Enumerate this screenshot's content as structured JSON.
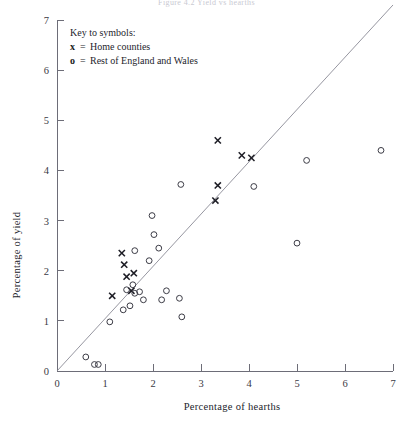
{
  "figure": {
    "title_partial": "Figure 4.2  Yield vs hearths"
  },
  "legend": {
    "heading": "Key to symbols:",
    "entries": [
      {
        "symbol": "x",
        "equals": "=",
        "label": "Home counties"
      },
      {
        "symbol": "o",
        "equals": "=",
        "label": "Rest of England and Wales"
      }
    ]
  },
  "chart_data": {
    "type": "scatter",
    "title": "",
    "xlabel": "Percentage of hearths",
    "ylabel": "Percentage of yield",
    "xlim": [
      0,
      7
    ],
    "ylim": [
      0,
      7
    ],
    "xticks": [
      "0",
      "1",
      "2",
      "3",
      "4",
      "5",
      "6",
      "7"
    ],
    "yticks": [
      "0",
      "1",
      "2",
      "3",
      "4",
      "5",
      "6",
      "7"
    ],
    "grid": false,
    "legend_position": "top-left",
    "reference_line": {
      "label": "y = x identity line",
      "x": [
        0.0,
        7.0
      ],
      "y": [
        0.0,
        7.3
      ],
      "color": "#8a8a95"
    },
    "series": [
      {
        "name": "Home counties",
        "marker": "x",
        "color": "#1d1d25",
        "points": [
          [
            1.15,
            1.5
          ],
          [
            1.35,
            2.35
          ],
          [
            1.4,
            2.12
          ],
          [
            1.45,
            1.88
          ],
          [
            1.6,
            1.95
          ],
          [
            1.55,
            1.6
          ],
          [
            3.35,
            4.6
          ],
          [
            3.35,
            3.7
          ],
          [
            3.3,
            3.4
          ],
          [
            3.85,
            4.3
          ],
          [
            4.05,
            4.25
          ]
        ]
      },
      {
        "name": "Rest of England and Wales",
        "marker": "o",
        "color": "#3c3c46",
        "points": [
          [
            0.6,
            0.28
          ],
          [
            0.78,
            0.13
          ],
          [
            0.86,
            0.13
          ],
          [
            1.1,
            0.98
          ],
          [
            1.38,
            1.22
          ],
          [
            1.52,
            1.3
          ],
          [
            1.45,
            1.62
          ],
          [
            1.58,
            1.72
          ],
          [
            1.62,
            1.55
          ],
          [
            1.72,
            1.58
          ],
          [
            1.8,
            1.42
          ],
          [
            1.62,
            2.4
          ],
          [
            1.92,
            2.2
          ],
          [
            1.98,
            3.1
          ],
          [
            2.02,
            2.72
          ],
          [
            2.12,
            2.45
          ],
          [
            2.18,
            1.42
          ],
          [
            2.28,
            1.6
          ],
          [
            2.55,
            1.45
          ],
          [
            2.6,
            1.08
          ],
          [
            2.58,
            3.72
          ],
          [
            4.1,
            3.68
          ],
          [
            5.0,
            2.55
          ],
          [
            5.2,
            4.2
          ],
          [
            6.75,
            4.4
          ]
        ]
      }
    ]
  }
}
